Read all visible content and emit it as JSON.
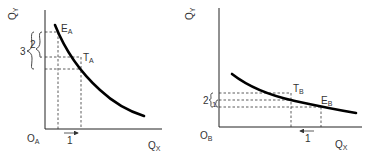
{
  "figure": {
    "type": "economics indifference-curve diagram, two panels",
    "panels": [
      {
        "id": "A",
        "y_axis_label": "Q",
        "y_axis_sub": "Y",
        "x_axis_label": "Q",
        "x_axis_sub": "X",
        "origin_label": "O",
        "origin_sub": "A",
        "point_E_label": "E",
        "point_E_sub": "A",
        "point_T_label": "T",
        "point_T_sub": "A",
        "brace_outer_value": "3",
        "brace_inner_value": "2",
        "x_change_value": "1",
        "x_change_direction": "right"
      },
      {
        "id": "B",
        "y_axis_label": "Q",
        "y_axis_sub": "Y",
        "x_axis_label": "Q",
        "x_axis_sub": "X",
        "origin_label": "O",
        "origin_sub": "B",
        "point_E_label": "E",
        "point_E_sub": "B",
        "point_T_label": "T",
        "point_T_sub": "B",
        "brace_outer_value": "2",
        "brace_inner_value": "1",
        "x_change_value": "1",
        "x_change_direction": "left"
      }
    ]
  },
  "colors": {
    "curve": "#000000",
    "axis": "#222222",
    "text": "#333333",
    "background": "#ffffff"
  }
}
